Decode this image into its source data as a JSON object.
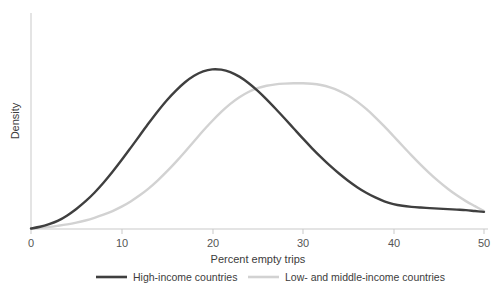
{
  "chart_data": {
    "type": "line",
    "title": "",
    "xlabel": "Percent empty trips",
    "ylabel": "Density",
    "xlim": [
      0,
      50
    ],
    "ylim": [
      0,
      1.08
    ],
    "grid": false,
    "legend_position": "bottom",
    "xticks": [
      "0",
      "10",
      "20",
      "30",
      "40",
      "50"
    ],
    "xtick_values": [
      0,
      10,
      20,
      30,
      40,
      50
    ],
    "yticks": [],
    "series": [
      {
        "name": "High-income countries",
        "color": "#3f3f3f",
        "x": [
          0,
          1,
          2,
          3,
          4,
          5,
          6,
          7,
          8,
          9,
          10,
          11,
          12,
          13,
          14,
          15,
          16,
          17,
          18,
          19,
          20,
          21,
          22,
          23,
          24,
          25,
          26,
          27,
          28,
          29,
          30,
          31,
          32,
          33,
          34,
          35,
          36,
          37,
          38,
          39,
          40,
          41,
          42,
          43,
          44,
          45,
          46,
          47,
          48,
          49,
          50
        ],
        "values": [
          0.0,
          0.01,
          0.025,
          0.045,
          0.075,
          0.112,
          0.155,
          0.205,
          0.262,
          0.325,
          0.392,
          0.462,
          0.533,
          0.604,
          0.672,
          0.735,
          0.79,
          0.838,
          0.875,
          0.9,
          0.912,
          0.91,
          0.896,
          0.87,
          0.834,
          0.79,
          0.74,
          0.686,
          0.63,
          0.573,
          0.516,
          0.461,
          0.409,
          0.36,
          0.315,
          0.274,
          0.237,
          0.205,
          0.178,
          0.156,
          0.14,
          0.13,
          0.124,
          0.12,
          0.117,
          0.114,
          0.111,
          0.108,
          0.105,
          0.1,
          0.095
        ]
      },
      {
        "name": "Low- and middle-income countries",
        "color": "#d2d2d2",
        "x": [
          0,
          1,
          2,
          3,
          4,
          5,
          6,
          7,
          8,
          9,
          10,
          11,
          12,
          13,
          14,
          15,
          16,
          17,
          18,
          19,
          20,
          21,
          22,
          23,
          24,
          25,
          26,
          27,
          28,
          29,
          30,
          31,
          32,
          33,
          34,
          35,
          36,
          37,
          38,
          39,
          40,
          41,
          42,
          43,
          44,
          45,
          46,
          47,
          48,
          49,
          50
        ],
        "values": [
          0.0,
          0.004,
          0.009,
          0.016,
          0.024,
          0.034,
          0.046,
          0.061,
          0.079,
          0.1,
          0.125,
          0.155,
          0.19,
          0.23,
          0.276,
          0.327,
          0.382,
          0.44,
          0.5,
          0.56,
          0.616,
          0.668,
          0.714,
          0.752,
          0.782,
          0.804,
          0.818,
          0.826,
          0.83,
          0.832,
          0.832,
          0.829,
          0.822,
          0.809,
          0.789,
          0.762,
          0.727,
          0.685,
          0.637,
          0.585,
          0.53,
          0.474,
          0.419,
          0.366,
          0.316,
          0.27,
          0.228,
          0.19,
          0.157,
          0.128,
          0.1
        ]
      }
    ],
    "annotations": []
  },
  "axes": {
    "y_label": "Density",
    "x_label": "Percent empty trips"
  },
  "legend": {
    "items": [
      {
        "label": "High-income countries",
        "color": "#3f3f3f"
      },
      {
        "label": "Low- and middle-income countries",
        "color": "#d2d2d2"
      }
    ]
  }
}
